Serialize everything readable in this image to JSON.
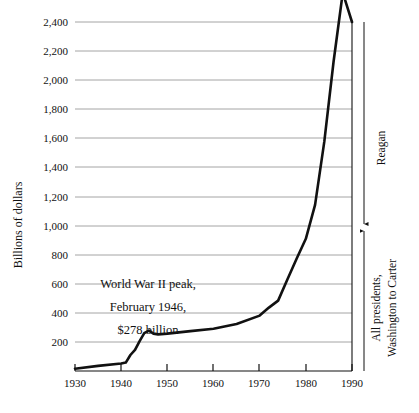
{
  "chart_data": {
    "type": "line",
    "title": "",
    "xlabel": "",
    "ylabel": "Billions of dollars",
    "xlim": [
      1930,
      1990
    ],
    "ylim": [
      0,
      2400
    ],
    "grid": true,
    "legend_position": "none",
    "x_ticks": [
      "1930",
      "1940",
      "1950",
      "1960",
      "1970",
      "1980",
      "1990"
    ],
    "y_ticks": [
      "200",
      "400",
      "600",
      "800",
      "1,000",
      "1,200",
      "1,400",
      "1,600",
      "1,800",
      "2,000",
      "2,200",
      "2,400"
    ],
    "series": [
      {
        "name": "Gross federal debt",
        "x": [
          1930,
          1935,
          1940,
          1941,
          1942,
          1943,
          1944,
          1945,
          1946,
          1947,
          1948,
          1950,
          1955,
          1960,
          1965,
          1970,
          1972,
          1974,
          1976,
          1978,
          1980,
          1982,
          1984,
          1986,
          1988,
          1990
        ],
        "values": [
          16,
          35,
          51,
          58,
          110,
          145,
          205,
          260,
          278,
          257,
          252,
          257,
          274,
          291,
          323,
          381,
          436,
          484,
          629,
          772,
          909,
          1142,
          1577,
          2125,
          2602,
          2400
        ]
      }
    ],
    "annotations": [
      {
        "name": "wwii-peak-note",
        "lines": [
          "World War II peak,",
          "February 1946,",
          "$278 billion"
        ],
        "x": 1944,
        "y": 600
      },
      {
        "name": "reagan-bracket",
        "label": "Reagan",
        "from_year": 1981,
        "to_year": 1990,
        "span_top": 2400,
        "span_bottom": 1000
      },
      {
        "name": "all-presidents-bracket",
        "label_line1": "All presidents,",
        "label_line2": "Washington to Carter",
        "span_top": 1000,
        "span_bottom": 0
      }
    ]
  },
  "colors": {
    "line": "#111111",
    "grid": "#9a9a9a",
    "axis": "#111111",
    "text": "#111111",
    "background": "#ffffff"
  }
}
